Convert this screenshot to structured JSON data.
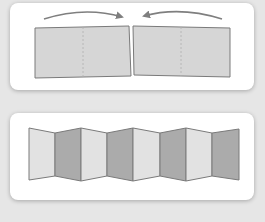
{
  "colors": {
    "background": "#e6e6e6",
    "card": "#ffffff",
    "panel_light": "#dcdcdc",
    "panel_mid": "#d2d2d2",
    "panel_dark": "#a9a9a9",
    "panel_lighter": "#e4e4e4",
    "outline": "#7a7a7a",
    "arrow": "#7f7f7f",
    "fold_line": "#b5b5b5"
  },
  "diagrams": [
    {
      "name": "fold-in-half",
      "panels": 2,
      "folds_per_panel": 1,
      "arrows": [
        "right-to-center",
        "left-to-center"
      ]
    },
    {
      "name": "accordion-fold",
      "panels": 8,
      "pattern": [
        "light",
        "dark",
        "light",
        "dark",
        "light",
        "dark",
        "light",
        "dark"
      ]
    }
  ]
}
